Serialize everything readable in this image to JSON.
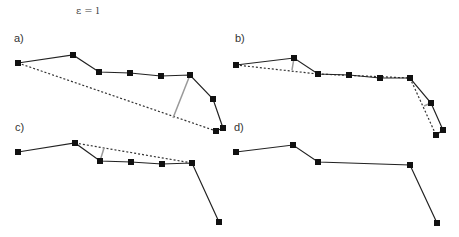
{
  "title": "ε = l",
  "colors": {
    "polyline": "#222222",
    "vertex": "#111111",
    "dotted": "#333333",
    "distance": "#999999"
  },
  "panels": [
    {
      "id": "a",
      "label": "a)",
      "label_pos": [
        17,
        38
      ],
      "points": [
        [
          18,
          63
        ],
        [
          73,
          55
        ],
        [
          99,
          72
        ],
        [
          130,
          73
        ],
        [
          161,
          76
        ],
        [
          190,
          75
        ],
        [
          213,
          99
        ],
        [
          223,
          128
        ],
        [
          216,
          131
        ]
      ],
      "dotted": [
        [
          [
            18,
            63
          ],
          [
            216,
            131
          ]
        ]
      ],
      "distance": [
        [
          [
            190,
            75
          ],
          [
            173,
            118
          ]
        ]
      ]
    },
    {
      "id": "b",
      "label": "b)",
      "label_pos": [
        235,
        38
      ],
      "points": [
        [
          236,
          65
        ],
        [
          294,
          58
        ],
        [
          318,
          74
        ],
        [
          349,
          75
        ],
        [
          380,
          78
        ],
        [
          410,
          78
        ],
        [
          431,
          103
        ],
        [
          443,
          130
        ],
        [
          436,
          135
        ]
      ],
      "dotted": [
        [
          [
            236,
            65
          ],
          [
            318,
            74
          ]
        ],
        [
          [
            318,
            74
          ],
          [
            410,
            78
          ]
        ],
        [
          [
            410,
            78
          ],
          [
            436,
            135
          ]
        ]
      ],
      "distance": [
        [
          [
            294,
            58
          ],
          [
            292,
            70
          ]
        ],
        [
          [
            431,
            103
          ],
          [
            424,
            106
          ]
        ]
      ]
    },
    {
      "id": "c",
      "label": "c)",
      "label_pos": [
        17,
        127
      ],
      "points": [
        [
          18,
          152
        ],
        [
          75,
          143
        ],
        [
          100,
          161
        ],
        [
          131,
          162
        ],
        [
          162,
          164
        ],
        [
          192,
          163
        ],
        [
          219,
          222
        ]
      ],
      "dotted": [
        [
          [
            75,
            143
          ],
          [
            192,
            163
          ]
        ]
      ],
      "distance": [
        [
          [
            100,
            161
          ],
          [
            104,
            148
          ]
        ]
      ]
    },
    {
      "id": "d",
      "label": "d)",
      "label_pos": [
        235,
        127
      ],
      "points": [
        [
          236,
          152
        ],
        [
          293,
          145
        ],
        [
          318,
          162
        ],
        [
          410,
          165
        ],
        [
          437,
          223
        ]
      ],
      "dotted": [],
      "distance": []
    }
  ]
}
